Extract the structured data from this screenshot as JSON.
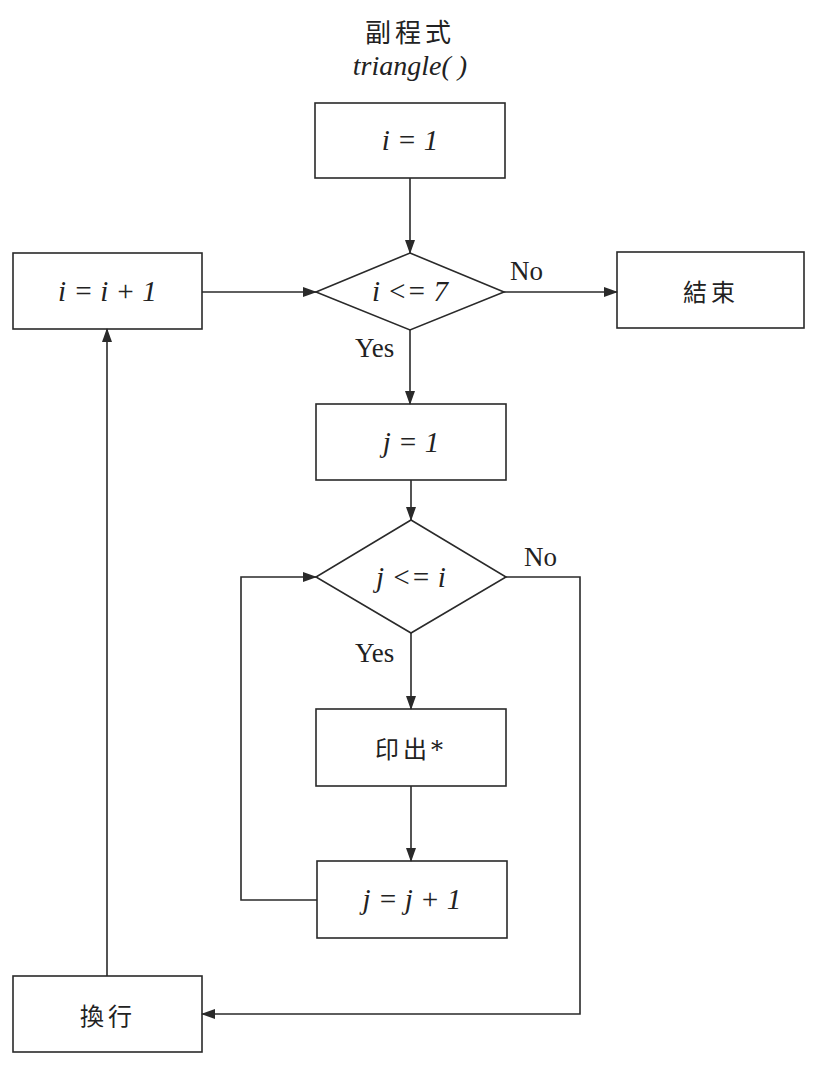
{
  "title": {
    "line1": "副程式",
    "line2": "triangle( )"
  },
  "nodes": {
    "init_i": {
      "type": "process",
      "text": "i = 1"
    },
    "cond_i": {
      "type": "decision",
      "text": "i <= 7"
    },
    "end": {
      "type": "process",
      "text": "結束"
    },
    "inc_i": {
      "type": "process",
      "text": "i = i + 1"
    },
    "init_j": {
      "type": "process",
      "text": "j = 1"
    },
    "cond_j": {
      "type": "decision",
      "text": "j <= i"
    },
    "print": {
      "type": "process",
      "text": "印出*"
    },
    "inc_j": {
      "type": "process",
      "text": "j = j + 1"
    },
    "newline": {
      "type": "process",
      "text": "換行"
    }
  },
  "edge_labels": {
    "cond_i_no": "No",
    "cond_i_yes": "Yes",
    "cond_j_no": "No",
    "cond_j_yes": "Yes"
  },
  "colors": {
    "stroke": "#2a2a2a",
    "background": "#ffffff"
  }
}
